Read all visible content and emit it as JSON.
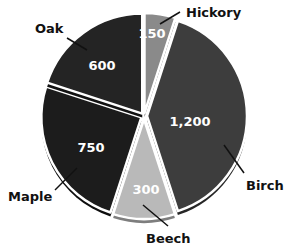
{
  "chart_data": {
    "type": "pie",
    "title": "",
    "start_angle_deg": 0,
    "direction": "clockwise",
    "total": 3000,
    "slices": [
      {
        "label": "Hickory",
        "value": 150,
        "display": "150",
        "color": "#8a8a8a",
        "edge": "#5e5e5e"
      },
      {
        "label": "Birch",
        "value": 1200,
        "display": "1,200",
        "color": "#3d3d3d",
        "edge": "#262626"
      },
      {
        "label": "Beech",
        "value": 300,
        "display": "300",
        "color": "#b9b9b9",
        "edge": "#7e7e7e"
      },
      {
        "label": "Maple",
        "value": 750,
        "display": "750",
        "color": "#1c1c1c",
        "edge": "#0e0e0e"
      },
      {
        "label": "Oak",
        "value": 600,
        "display": "600",
        "color": "#242424",
        "edge": "#121212"
      }
    ],
    "legend": "none",
    "labels": "callout lines to category names; values inside slices"
  },
  "layout": {
    "center": [
      144,
      116
    ],
    "radius": 100,
    "explode": 3,
    "value_positions": [
      [
        152,
        34
      ],
      [
        190,
        122
      ],
      [
        146,
        190
      ],
      [
        91,
        148
      ],
      [
        102,
        66
      ]
    ],
    "callouts": [
      {
        "from": [
          160,
          24
        ],
        "to": [
          180,
          12
        ],
        "text_pos": [
          186,
          17
        ],
        "anchor": "start"
      },
      {
        "from": [
          224,
          145
        ],
        "to": [
          244,
          173
        ],
        "text_pos": [
          246,
          190
        ],
        "anchor": "start"
      },
      {
        "from": [
          143,
          205
        ],
        "to": [
          168,
          226
        ],
        "text_pos": [
          146,
          243
        ],
        "anchor": "start"
      },
      {
        "from": [
          77,
          168
        ],
        "to": [
          55,
          190
        ],
        "text_pos": [
          8,
          201
        ],
        "anchor": "start"
      },
      {
        "from": [
          87,
          50
        ],
        "to": [
          67,
          38
        ],
        "text_pos": [
          35,
          33
        ],
        "anchor": "start"
      }
    ]
  }
}
